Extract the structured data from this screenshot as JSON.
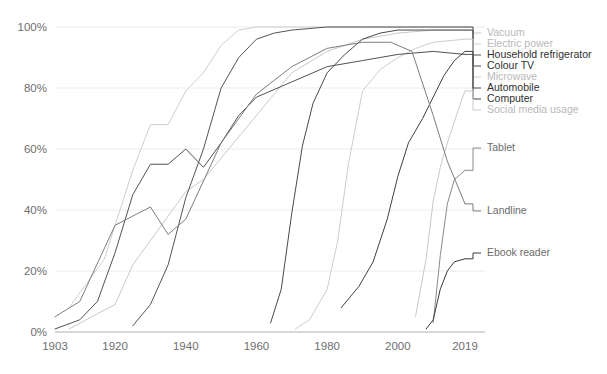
{
  "chart_data": {
    "type": "line",
    "title": "",
    "xlabel": "",
    "ylabel": "",
    "xlim": [
      1903,
      2019
    ],
    "ylim": [
      0,
      100
    ],
    "grid": true,
    "legend_position": "right-inline-labels",
    "x_ticks": [
      "1903",
      "1920",
      "1940",
      "1960",
      "1980",
      "2000",
      "2019"
    ],
    "x_tick_values": [
      1903,
      1920,
      1940,
      1960,
      1980,
      2000,
      2019
    ],
    "y_ticks": [
      "0%",
      "20%",
      "40%",
      "60%",
      "80%",
      "100%"
    ],
    "y_tick_values": [
      0,
      20,
      40,
      60,
      80,
      100
    ],
    "series": [
      {
        "name": "Vacuum",
        "color": "#c9c9c9",
        "label_shade": "light",
        "label_y": 33,
        "x": [
          1907,
          1915,
          1920,
          1925,
          1930,
          1935,
          1940,
          1945,
          1950,
          1955,
          1960,
          1965,
          1970,
          1980,
          1990,
          2000,
          2010,
          2019
        ],
        "values": [
          1,
          6,
          9,
          22,
          30,
          38,
          46,
          50,
          57,
          64,
          71,
          78,
          85,
          92,
          96,
          98,
          99,
          99
        ]
      },
      {
        "name": "Electric power",
        "color": "#cfcfcf",
        "label_shade": "light",
        "label_y": 44,
        "x": [
          1907,
          1912,
          1917,
          1920,
          1925,
          1930,
          1935,
          1940,
          1945,
          1950,
          1955,
          1960,
          1970,
          1980,
          1990,
          2000,
          2019
        ],
        "values": [
          8,
          16,
          24,
          35,
          53,
          68,
          68,
          79,
          85,
          94,
          99,
          100,
          100,
          100,
          100,
          100,
          100
        ]
      },
      {
        "name": "Household refrigerator",
        "color": "#545454",
        "label_shade": "dark",
        "label_y": 55,
        "x": [
          1925,
          1930,
          1935,
          1940,
          1945,
          1950,
          1955,
          1960,
          1965,
          1970,
          1980,
          1990,
          2000,
          2010,
          2019
        ],
        "values": [
          2,
          9,
          22,
          44,
          60,
          80,
          90,
          96,
          98,
          99,
          100,
          100,
          100,
          100,
          100
        ]
      },
      {
        "name": "Colour TV",
        "color": "#4a4a4a",
        "label_shade": "dark",
        "label_y": 66,
        "x": [
          1964,
          1967,
          1970,
          1973,
          1976,
          1980,
          1985,
          1990,
          1995,
          2000,
          2010,
          2019
        ],
        "values": [
          3,
          14,
          39,
          61,
          75,
          85,
          91,
          96,
          98,
          99,
          99,
          99
        ]
      },
      {
        "name": "Microwave",
        "color": "#cdcdcd",
        "label_shade": "light",
        "label_y": 77,
        "x": [
          1971,
          1975,
          1980,
          1983,
          1986,
          1990,
          1995,
          2000,
          2005,
          2010,
          2019
        ],
        "values": [
          1,
          4,
          14,
          30,
          55,
          79,
          86,
          90,
          93,
          95,
          96
        ]
      },
      {
        "name": "Automobile",
        "color": "#525252",
        "label_shade": "dark",
        "label_y": 88,
        "x": [
          1903,
          1910,
          1915,
          1920,
          1925,
          1930,
          1935,
          1940,
          1945,
          1950,
          1955,
          1960,
          1970,
          1980,
          1990,
          2000,
          2010,
          2019
        ],
        "values": [
          1,
          4,
          10,
          26,
          45,
          55,
          55,
          60,
          54,
          62,
          71,
          77,
          82,
          87,
          89,
          91,
          92,
          91
        ]
      },
      {
        "name": "Computer",
        "color": "#404040",
        "label_shade": "dark",
        "label_y": 99,
        "x": [
          1984,
          1989,
          1993,
          1997,
          2000,
          2003,
          2007,
          2010,
          2013,
          2016,
          2019
        ],
        "values": [
          8,
          15,
          23,
          37,
          51,
          62,
          70,
          77,
          84,
          89,
          92
        ]
      },
      {
        "name": "Social media usage",
        "color": "#c9c9c9",
        "label_shade": "light",
        "label_y": 110,
        "x": [
          2005,
          2008,
          2010,
          2012,
          2014,
          2016,
          2018,
          2019
        ],
        "values": [
          5,
          24,
          43,
          54,
          62,
          69,
          76,
          79
        ]
      },
      {
        "name": "Tablet",
        "color": "#8a8a8a",
        "label_shade": "mid",
        "label_y": 148,
        "x": [
          2010,
          2012,
          2014,
          2016,
          2018,
          2019
        ],
        "values": [
          3,
          25,
          42,
          50,
          52,
          53
        ]
      },
      {
        "name": "Landline",
        "color": "#7d7d7d",
        "label_shade": "mid",
        "label_y": 211,
        "x": [
          1903,
          1910,
          1920,
          1930,
          1935,
          1940,
          1950,
          1960,
          1970,
          1980,
          1990,
          1998,
          2004,
          2010,
          2014,
          2019
        ],
        "values": [
          5,
          10,
          35,
          41,
          32,
          37,
          62,
          78,
          87,
          93,
          95,
          95,
          92,
          71,
          56,
          42
        ]
      },
      {
        "name": "Ebook reader",
        "color": "#3a3a3a",
        "label_shade": "mid",
        "label_y": 253,
        "x": [
          2008,
          2010,
          2012,
          2014,
          2016,
          2019
        ],
        "values": [
          1,
          4,
          14,
          20,
          23,
          24
        ]
      }
    ]
  },
  "legend": {
    "items": [
      {
        "label": "Vacuum"
      },
      {
        "label": "Electric power"
      },
      {
        "label": "Household refrigerator"
      },
      {
        "label": "Colour TV"
      },
      {
        "label": "Microwave"
      },
      {
        "label": "Automobile"
      },
      {
        "label": "Computer"
      },
      {
        "label": "Social media usage"
      },
      {
        "label": "Tablet"
      },
      {
        "label": "Landline"
      },
      {
        "label": "Ebook reader"
      }
    ]
  },
  "axis": {
    "y_labels": [
      "100%",
      "80%",
      "60%",
      "40%",
      "20%",
      "0%"
    ],
    "x_labels": [
      "1903",
      "1920",
      "1940",
      "1960",
      "1980",
      "2000",
      "2019"
    ]
  }
}
